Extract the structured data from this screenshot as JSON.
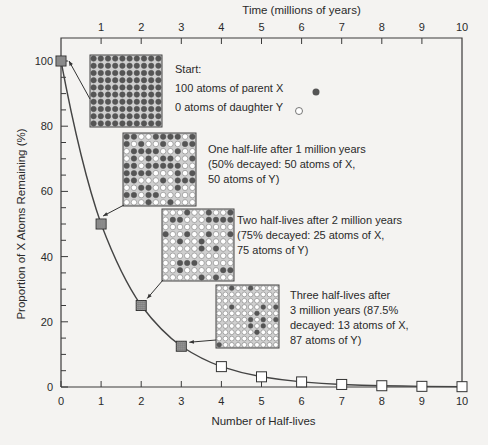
{
  "chart_data": {
    "type": "line",
    "title": "",
    "xlabel": "Number of Half-lives",
    "ylabel": "Proportion of X Atoms Remaining (%)",
    "top_axis_label": "Time (millions of years)",
    "x": [
      0,
      1,
      2,
      3,
      4,
      5,
      6,
      7,
      8,
      9,
      10
    ],
    "series": [
      {
        "name": "Parent X remaining (%)",
        "values": [
          100,
          50,
          25,
          12.5,
          6.25,
          3.125,
          1.5625,
          0.78,
          0.39,
          0.2,
          0.1
        ]
      }
    ],
    "xlim": [
      0,
      10
    ],
    "ylim": [
      0,
      100
    ],
    "x_ticks": [
      "0",
      "1",
      "2",
      "3",
      "4",
      "5",
      "6",
      "7",
      "8",
      "9",
      "10"
    ],
    "top_ticks": [
      "1",
      "2",
      "3",
      "4",
      "5",
      "6",
      "7",
      "8",
      "9",
      "10"
    ],
    "y_ticks": [
      "0",
      "20",
      "40",
      "60",
      "80",
      "100"
    ],
    "grid": false,
    "legend": {
      "parent": "parent X (filled circle)",
      "daughter": "daughter Y (open circle)"
    },
    "annotations": [
      {
        "at_x": 0,
        "lines": [
          "Start:",
          "100 atoms of parent X",
          "0 atoms of daughter Y"
        ],
        "filled": 100
      },
      {
        "at_x": 1,
        "lines": [
          "One half-life after 1 million years",
          "(50% decayed: 50 atoms of X,",
          "50 atoms of Y)"
        ],
        "filled": 50
      },
      {
        "at_x": 2,
        "lines": [
          "Two half-lives after 2 million years",
          "(75% decayed: 25 atoms of X,",
          "75 atoms of Y)"
        ],
        "filled": 25
      },
      {
        "at_x": 3,
        "lines": [
          "Three half-lives after",
          "3 million years (87.5%",
          "decayed: 13 atoms of X,",
          "87 atoms of Y)"
        ],
        "filled": 13
      }
    ]
  },
  "colors": {
    "background": "#f4f3f1",
    "axis": "#3a3a3a",
    "filled_atom": "#555555",
    "empty_atom": "#ffffff",
    "marker_shaded": "#9a9a9a",
    "marker_open": "#ffffff"
  }
}
